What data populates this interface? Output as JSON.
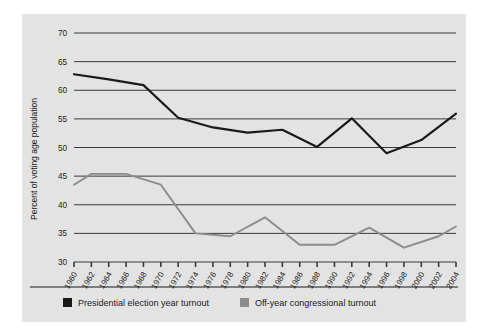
{
  "chart_data": {
    "type": "line",
    "title": "",
    "xlabel": "",
    "ylabel": "Percent of voting age population",
    "ylim": [
      30,
      70
    ],
    "yticks": [
      30,
      35,
      40,
      45,
      50,
      55,
      60,
      65,
      70
    ],
    "ytick_labels": [
      "30",
      "35",
      "40",
      "45",
      "50",
      "55",
      "60",
      "65",
      "70"
    ],
    "grid": true,
    "legend_position": "bottom",
    "x": [
      1960,
      1962,
      1964,
      1966,
      1968,
      1970,
      1972,
      1974,
      1976,
      1978,
      1980,
      1982,
      1984,
      1986,
      1988,
      1990,
      1992,
      1994,
      1996,
      1998,
      2000,
      2002,
      2004
    ],
    "xtick_labels": [
      "1960",
      "1962",
      "1964",
      "1966",
      "1968",
      "1970",
      "1972",
      "1974",
      "1976",
      "1978",
      "1980",
      "1982",
      "1984",
      "1986",
      "1988",
      "1990",
      "1992",
      "1994",
      "1996",
      "1998",
      "2000",
      "2002",
      "2004"
    ],
    "series": [
      {
        "name": "Presidential election year turnout",
        "color": "#1a1a1a",
        "points": [
          {
            "x": 1960,
            "y": 62.8
          },
          {
            "x": 1964,
            "y": 61.9
          },
          {
            "x": 1968,
            "y": 60.9
          },
          {
            "x": 1972,
            "y": 55.2
          },
          {
            "x": 1976,
            "y": 53.5
          },
          {
            "x": 1980,
            "y": 52.6
          },
          {
            "x": 1984,
            "y": 53.1
          },
          {
            "x": 1988,
            "y": 50.1
          },
          {
            "x": 1992,
            "y": 55.1
          },
          {
            "x": 1996,
            "y": 49.0
          },
          {
            "x": 2000,
            "y": 51.3
          },
          {
            "x": 2004,
            "y": 55.9
          }
        ]
      },
      {
        "name": "Off-year congressional turnout",
        "color": "#8c8c8c",
        "points": [
          {
            "x": 1960,
            "y": 43.5
          },
          {
            "x": 1962,
            "y": 45.4
          },
          {
            "x": 1966,
            "y": 45.4
          },
          {
            "x": 1970,
            "y": 43.5
          },
          {
            "x": 1974,
            "y": 35.0
          },
          {
            "x": 1978,
            "y": 34.5
          },
          {
            "x": 1982,
            "y": 37.8
          },
          {
            "x": 1986,
            "y": 33.0
          },
          {
            "x": 1990,
            "y": 33.0
          },
          {
            "x": 1994,
            "y": 36.0
          },
          {
            "x": 1998,
            "y": 32.5
          },
          {
            "x": 2002,
            "y": 34.5
          },
          {
            "x": 2004,
            "y": 36.2
          }
        ]
      }
    ],
    "legend": [
      {
        "label": "Presidential election year turnout",
        "color": "#1a1a1a"
      },
      {
        "label": "Off-year congressional turnout",
        "color": "#8c8c8c"
      }
    ]
  },
  "colors": {
    "panel_background": "#e3e3e3",
    "page_background": "#ffffff",
    "gridline": "#3a3a3a",
    "presidential": "#1a1a1a",
    "offyear": "#8c8c8c",
    "text": "#1a1a1a"
  }
}
